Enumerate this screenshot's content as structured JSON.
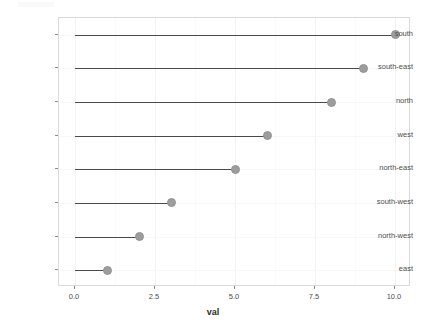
{
  "chart_data": {
    "type": "bar",
    "subtype": "lollipop-horizontal",
    "title": "",
    "subtitle": "",
    "xlabel": "val",
    "ylabel": "",
    "categories": [
      "south",
      "south-east",
      "north",
      "west",
      "north-east",
      "south-west",
      "north-west",
      "east"
    ],
    "values": [
      10,
      9,
      8,
      6,
      5,
      3,
      2,
      1
    ],
    "series": [
      {
        "name": "val",
        "values": [
          10,
          9,
          8,
          6,
          5,
          3,
          2,
          1
        ]
      }
    ],
    "points": [
      {
        "category": "south",
        "value": 10
      },
      {
        "category": "south-east",
        "value": 9
      },
      {
        "category": "north",
        "value": 8
      },
      {
        "category": "west",
        "value": 6
      },
      {
        "category": "north-east",
        "value": 5
      },
      {
        "category": "south-west",
        "value": 3
      },
      {
        "category": "north-west",
        "value": 2
      },
      {
        "category": "east",
        "value": 1
      }
    ],
    "x_ticks": [
      0.0,
      2.5,
      5.0,
      7.5,
      10.0
    ],
    "x_tick_labels": [
      "0.0",
      "2.5",
      "5.0",
      "7.5",
      "10.0"
    ],
    "xlim": [
      -0.5,
      10.5
    ],
    "baseline": 0,
    "orientation": "horizontal",
    "grid": true,
    "grid_minor": true,
    "legend": "none",
    "colors": {
      "point": "#9d9d9d",
      "segment": "#4a4a4a",
      "panel_background": "#ffffff",
      "panel_border": "#d9d9d9",
      "grid_major": "#f2f2f2",
      "grid_minor": "#fafafa",
      "axis_text": "#4d4d4d",
      "axis_title": "#2b2b2b",
      "tick_mark": "#8c8c8c"
    }
  },
  "axis": {
    "x_title": "val",
    "x_tick_labels": [
      "0.0",
      "2.5",
      "5.0",
      "7.5",
      "10.0"
    ],
    "y_tick_labels": [
      "south",
      "south-east",
      "north",
      "west",
      "north-east",
      "south-west",
      "north-west",
      "east"
    ]
  }
}
